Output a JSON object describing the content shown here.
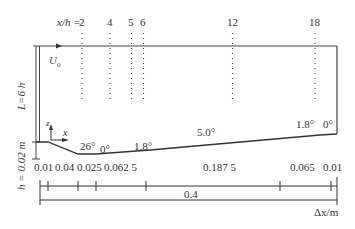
{
  "diagram": {
    "stations": {
      "prefix": "x/h = ",
      "values": [
        "2",
        "4",
        "5",
        "6",
        "12",
        "18"
      ]
    },
    "inlet_velocity_label": "U",
    "inlet_velocity_subscript": "0",
    "domain_height_label": "L=6 h",
    "step_height_label": "h = 0.02 m",
    "axes": {
      "z": "z",
      "x": "x"
    },
    "angles": [
      "26°",
      "0°",
      "1.8°",
      "5.0°",
      "1.8°",
      "0°"
    ],
    "segment_lengths": [
      "0.01",
      "0.04",
      "0.025",
      "0.062 5",
      "0.187 5",
      "0.065",
      "0.01"
    ],
    "total_length": "0.4",
    "length_axis_label": "Δx/m"
  }
}
